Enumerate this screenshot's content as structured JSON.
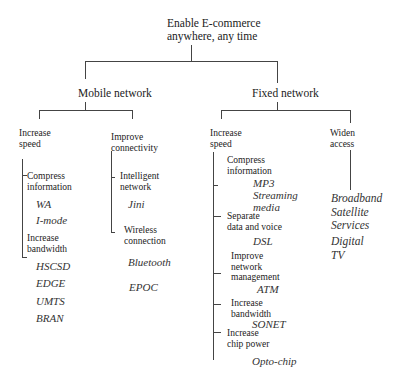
{
  "root": {
    "line1": "Enable E-commerce",
    "line2": "anywhere, any time"
  },
  "mobile": {
    "label": "Mobile network",
    "speed": {
      "line1": "Increase",
      "line2": "speed",
      "compress": {
        "line1": "Compress",
        "line2": "information",
        "examples": [
          "WA",
          "I-mode"
        ]
      },
      "bandwidth": {
        "line1": "Increase",
        "line2": "bandwidth",
        "examples": [
          "HSCSD",
          "EDGE",
          "UMTS",
          "BRAN"
        ]
      }
    },
    "connectivity": {
      "line1": "Improve",
      "line2": "connectivity",
      "intelligent": {
        "line1": "Intelligent",
        "line2": "network",
        "examples": [
          "Jini"
        ]
      },
      "wireless": {
        "line1": "Wireless",
        "line2": "connection",
        "examples": [
          "Bluetooth",
          "EPOC"
        ]
      }
    }
  },
  "fixed": {
    "label": "Fixed network",
    "speed": {
      "line1": "Increase",
      "line2": "speed",
      "compress": {
        "line1": "Compress",
        "line2": "information",
        "examples": [
          "MP3",
          "Streaming",
          "media"
        ]
      },
      "separate": {
        "line1": "Separate",
        "line2": "data and voice",
        "examples": [
          "DSL"
        ]
      },
      "management": {
        "line1": "Improve",
        "line2": "network",
        "line3": "management",
        "examples": [
          "ATM"
        ]
      },
      "bandwidth": {
        "line1": "Increase",
        "line2": "bandwidth",
        "examples": [
          "SONET"
        ]
      },
      "chip": {
        "line1": "Increase",
        "line2": "chip power",
        "examples": [
          "Opto-chip"
        ]
      }
    },
    "access": {
      "line1": "Widen",
      "line2": "access",
      "examples": [
        "Broadband",
        "Satellite",
        "Services",
        "Digital",
        "TV"
      ]
    }
  }
}
